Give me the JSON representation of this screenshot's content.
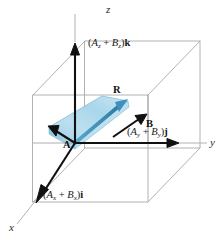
{
  "figure": {
    "background_color": "#ffffff"
  },
  "axes": [
    {
      "name": "z-axis",
      "letter": "z",
      "direction": "up"
    },
    {
      "name": "y-axis",
      "letter": "y",
      "direction": "right"
    },
    {
      "name": "x-axis",
      "letter": "x",
      "direction": "lower-left"
    }
  ],
  "axis_letters": {
    "z": "z",
    "y": "y",
    "x": "x"
  },
  "component_labels": {
    "z": {
      "open": "(",
      "a": "A",
      "a_sub": "z",
      "plus": " + ",
      "b": "B",
      "b_sub": "z",
      "close": ")",
      "unit": "k"
    },
    "y": {
      "open": "(",
      "a": "A",
      "a_sub": "y",
      "plus": " + ",
      "b": "B",
      "b_sub": "y",
      "close": ")",
      "unit": "j"
    },
    "x": {
      "open": "(",
      "a": "A",
      "a_sub": "x",
      "plus": " + ",
      "b": "B",
      "b_sub": "x",
      "close": ")",
      "unit": "i"
    }
  },
  "vectors": {
    "resultant": {
      "label": "R",
      "color": "#4a9ec8",
      "description": "resultant vector from origin to far corner"
    },
    "a": {
      "label": "A",
      "color": "#111111",
      "description": "vector A pointing to upper left"
    },
    "b": {
      "label": "B",
      "color": "#111111",
      "description": "vector B pointing to upper right"
    }
  },
  "colors": {
    "axis_black": "#111111",
    "box_gray": "#a9a9a9",
    "parallelogram_fill_light": "#cfe6f2",
    "parallelogram_fill_mid": "#a7d2e7",
    "parallelogram_fill_dark": "#8cc4de",
    "parallelogram_edge": "#6fa9c6",
    "resultant_blue": "#4a9ec8",
    "resultant_blue_dark": "#2f7ba3"
  },
  "geometry": {
    "origin": {
      "x": 75,
      "y": 143
    },
    "z_tip": {
      "x": 75,
      "y": 46
    },
    "y_tip": {
      "x": 178,
      "y": 143
    },
    "x_tip": {
      "x": 36,
      "y": 199
    },
    "r_tip": {
      "x": 128,
      "y": 101
    },
    "a_tip": {
      "x": 49,
      "y": 131
    },
    "b_tip": {
      "x": 146,
      "y": 117
    }
  }
}
